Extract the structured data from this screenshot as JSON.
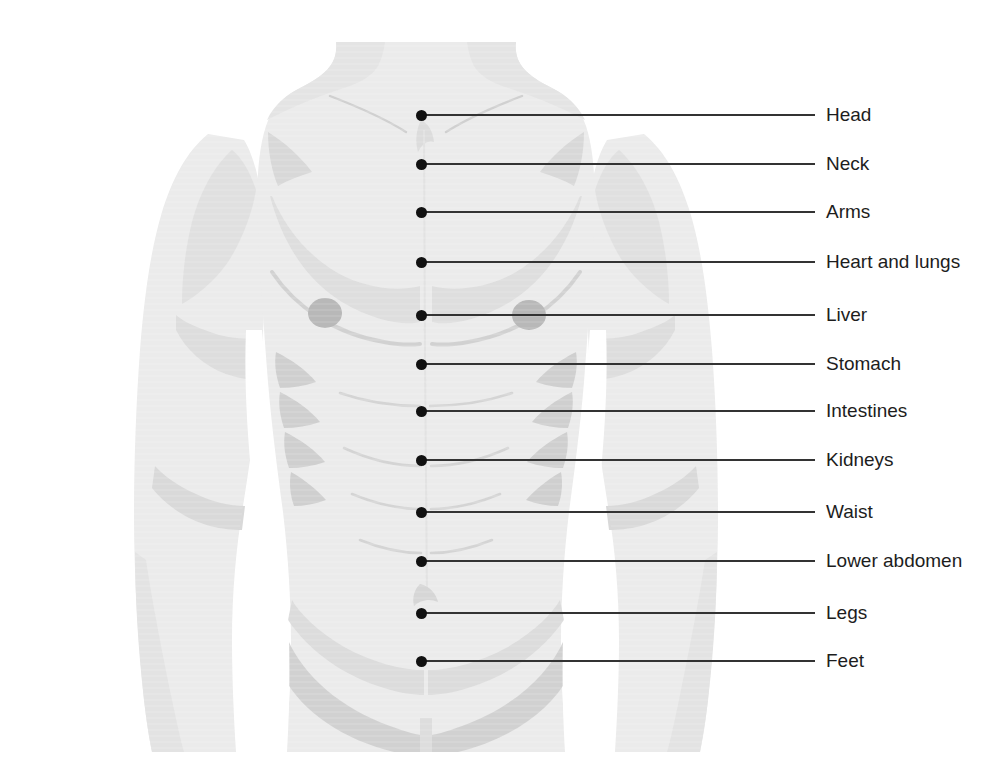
{
  "diagram": {
    "background_color": "#ffffff",
    "body_fill_color": "#ebebeb",
    "body_shading_color": "#d5d5d5",
    "body_shading_dark_color": "#c4c4c4",
    "nipple_color": "#b8b8b8",
    "marker_color": "#111111",
    "leader_line_color": "#333333",
    "label_text_color": "#1d1d1d",
    "marker_x": 421,
    "line_end_x": 815,
    "label_x": 826,
    "marker_diameter": 11
  },
  "callouts": [
    {
      "label": "Head",
      "y": 115
    },
    {
      "label": "Neck",
      "y": 164
    },
    {
      "label": "Arms",
      "y": 212
    },
    {
      "label": "Heart and lungs",
      "y": 262
    },
    {
      "label": "Liver",
      "y": 315
    },
    {
      "label": "Stomach",
      "y": 364
    },
    {
      "label": "Intestines",
      "y": 411
    },
    {
      "label": "Kidneys",
      "y": 460
    },
    {
      "label": "Waist",
      "y": 512
    },
    {
      "label": "Lower abdomen",
      "y": 561
    },
    {
      "label": "Legs",
      "y": 613
    },
    {
      "label": "Feet",
      "y": 661
    }
  ]
}
